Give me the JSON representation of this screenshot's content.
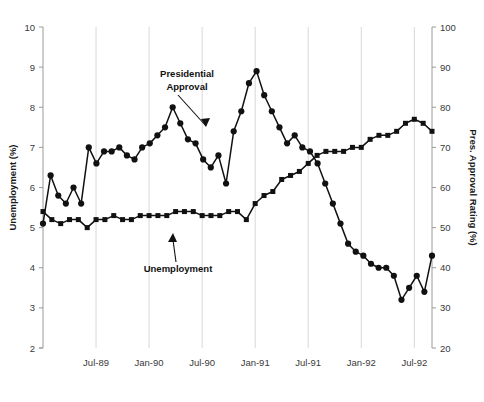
{
  "chart_data": {
    "type": "line",
    "title": "",
    "xlabel": "",
    "ylabel": "Unemployment (%)",
    "y2label": "Pres. Approval Rating (%)",
    "ylim": [
      2,
      10
    ],
    "y2lim": [
      20,
      100
    ],
    "yticks": [
      2,
      3,
      4,
      5,
      6,
      7,
      8,
      9,
      10
    ],
    "y2ticks": [
      20,
      30,
      40,
      50,
      60,
      70,
      80,
      90,
      100
    ],
    "xtick_labels": [
      "Jul-89",
      "Jan-90",
      "Jul-90",
      "Jan-91",
      "Jul-91",
      "Jan-92",
      "Jul-92"
    ],
    "xtick_index": [
      6,
      12,
      18,
      24,
      30,
      36,
      42
    ],
    "grid": "vertical",
    "legend": "annotations",
    "x_count": 45,
    "x_start": "Jan-89",
    "series": [
      {
        "name": "Unemployment",
        "axis": "left",
        "marker": "square",
        "unit": "%",
        "values": [
          5.4,
          5.2,
          5.1,
          5.2,
          5.2,
          5.0,
          5.2,
          5.2,
          5.3,
          5.2,
          5.2,
          5.3,
          5.3,
          5.3,
          5.3,
          5.4,
          5.4,
          5.4,
          5.3,
          5.3,
          5.3,
          5.4,
          5.4,
          5.2,
          5.6,
          5.8,
          5.9,
          6.2,
          6.3,
          6.4,
          6.6,
          6.8,
          6.9,
          6.9,
          6.9,
          7.0,
          7.0,
          7.2,
          7.3,
          7.3,
          7.4,
          7.6,
          7.7,
          7.6,
          7.4
        ]
      },
      {
        "name": "Presidential Approval",
        "axis": "right",
        "marker": "circle",
        "unit": "%",
        "values": [
          51,
          63,
          58,
          56,
          60,
          56,
          70,
          66,
          69,
          69,
          70,
          68,
          67,
          70,
          71,
          73,
          75,
          80,
          76,
          72,
          71,
          67,
          65,
          68,
          61,
          74,
          79,
          86,
          89,
          83,
          79,
          75,
          71,
          73,
          70,
          69,
          66,
          61,
          56,
          51,
          46,
          44,
          43,
          41,
          40,
          40,
          38,
          32,
          35,
          38,
          34,
          43
        ]
      }
    ],
    "annotations": [
      {
        "text": "Presidential Approval",
        "lines": [
          "Presidential",
          "Approval"
        ],
        "arrow": "down"
      },
      {
        "text": "Unemployment",
        "lines": [
          "Unemployment"
        ],
        "arrow": "up"
      }
    ]
  }
}
